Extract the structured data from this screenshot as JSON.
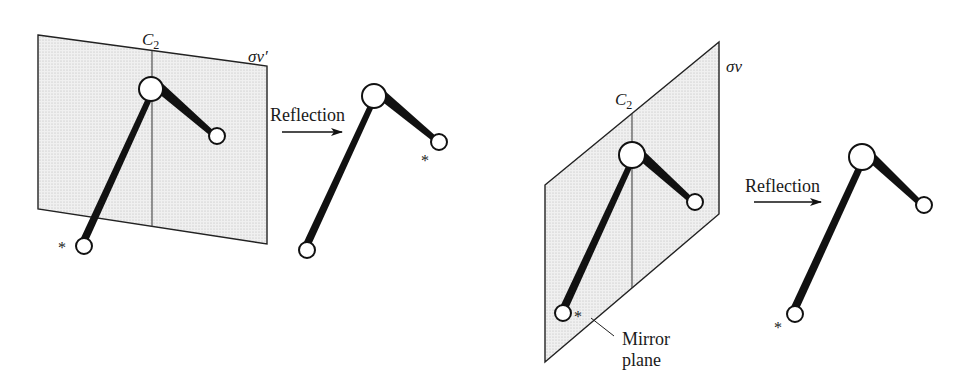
{
  "figure": {
    "panels": [
      {
        "id": "left",
        "plane_label": "σv′",
        "axis_label": "C",
        "axis_subscript": "2",
        "reflection_label": "Reflection",
        "star_symbol": "*"
      },
      {
        "id": "right",
        "plane_label": "σv",
        "axis_label": "C",
        "axis_subscript": "2",
        "reflection_label": "Reflection",
        "star_symbol": "*",
        "mirror_label_line1": "Mirror",
        "mirror_label_line2": "plane"
      }
    ],
    "colors": {
      "ink": "#111111",
      "plane_fill": "#ebebeb",
      "background": "#ffffff"
    }
  }
}
